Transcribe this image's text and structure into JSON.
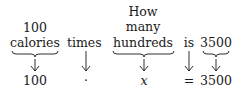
{
  "phrases": [
    {
      "lines": [
        "100",
        "calories"
      ],
      "translation": "100"
    },
    {
      "lines": [
        "times"
      ],
      "translation": "·"
    },
    {
      "lines": [
        "How",
        "many",
        "hundreds"
      ],
      "translation": "x"
    },
    {
      "lines": [
        "is"
      ],
      "translation": "="
    },
    {
      "lines": [
        "3500"
      ],
      "translation": "3500"
    }
  ],
  "equation": "100 · x = 3500"
}
